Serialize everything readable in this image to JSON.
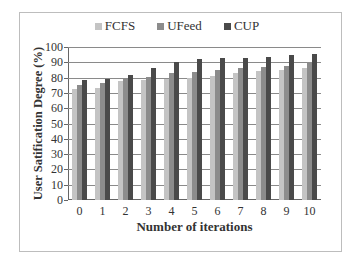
{
  "chart_data": {
    "type": "bar",
    "title": "",
    "xlabel": "Number of iterations",
    "ylabel": "User Satification Degree (%)",
    "ylim": [
      0,
      100
    ],
    "yticks": [
      0,
      10,
      20,
      30,
      40,
      50,
      60,
      70,
      80,
      90,
      100
    ],
    "grid": true,
    "legend_position": "top",
    "categories": [
      "0",
      "1",
      "2",
      "3",
      "4",
      "5",
      "6",
      "7",
      "8",
      "9",
      "10"
    ],
    "series": [
      {
        "name": "FCFS",
        "color": "#c4c4c4",
        "values": [
          72.5,
          73.5,
          77.8,
          78.2,
          79,
          79.8,
          81.3,
          83,
          84.2,
          85,
          86
        ]
      },
      {
        "name": "UFeed",
        "color": "#8c8c8c",
        "values": [
          75,
          76.5,
          79,
          80.2,
          83,
          83.8,
          85,
          86,
          87,
          87.5,
          90
        ]
      },
      {
        "name": "CUP",
        "color": "#4a4a4a",
        "values": [
          78.5,
          79.3,
          82,
          86,
          90.4,
          92,
          93,
          93,
          93.5,
          95,
          95.5
        ]
      }
    ]
  }
}
